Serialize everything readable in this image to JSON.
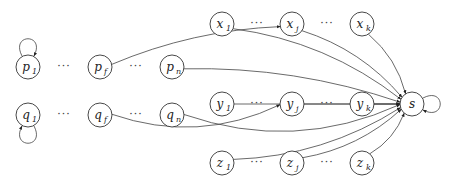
{
  "diagram": {
    "nodes": [
      {
        "id": "p1",
        "base": "p",
        "sub": "1",
        "cx": 28,
        "cy": 67
      },
      {
        "id": "pf",
        "base": "p",
        "sub": "f",
        "cx": 100,
        "cy": 67
      },
      {
        "id": "pn",
        "base": "p",
        "sub": "n",
        "cx": 172,
        "cy": 67
      },
      {
        "id": "q1",
        "base": "q",
        "sub": "1",
        "cx": 28,
        "cy": 115
      },
      {
        "id": "qf",
        "base": "q",
        "sub": "f",
        "cx": 100,
        "cy": 115
      },
      {
        "id": "qn",
        "base": "q",
        "sub": "n",
        "cx": 172,
        "cy": 115
      },
      {
        "id": "x1",
        "base": "x",
        "sub": "1",
        "cx": 222,
        "cy": 24
      },
      {
        "id": "xj",
        "base": "x",
        "sub": "j",
        "cx": 292,
        "cy": 24
      },
      {
        "id": "xk",
        "base": "x",
        "sub": "k",
        "cx": 362,
        "cy": 24
      },
      {
        "id": "y1",
        "base": "y",
        "sub": "1",
        "cx": 222,
        "cy": 104
      },
      {
        "id": "yj",
        "base": "y",
        "sub": "j",
        "cx": 292,
        "cy": 104
      },
      {
        "id": "yk",
        "base": "y",
        "sub": "k",
        "cx": 362,
        "cy": 104
      },
      {
        "id": "z1",
        "base": "z",
        "sub": "1",
        "cx": 222,
        "cy": 163
      },
      {
        "id": "zj",
        "base": "z",
        "sub": "j",
        "cx": 292,
        "cy": 163
      },
      {
        "id": "zk",
        "base": "z",
        "sub": "k",
        "cx": 362,
        "cy": 163
      },
      {
        "id": "s",
        "base": "s",
        "sub": "",
        "cx": 412,
        "cy": 104
      }
    ],
    "ellipsis": "···",
    "ellipsis_positions": [
      {
        "x": 64,
        "y": 67
      },
      {
        "x": 136,
        "y": 67
      },
      {
        "x": 64,
        "y": 115
      },
      {
        "x": 136,
        "y": 115
      },
      {
        "x": 257,
        "y": 24
      },
      {
        "x": 327,
        "y": 24
      },
      {
        "x": 257,
        "y": 104
      },
      {
        "x": 327,
        "y": 104
      },
      {
        "x": 257,
        "y": 163
      },
      {
        "x": 327,
        "y": 163
      }
    ],
    "edges": [
      {
        "from": "pf",
        "to": "xj"
      },
      {
        "from": "pn",
        "to": "s"
      },
      {
        "from": "x1",
        "to": "s"
      },
      {
        "from": "xj",
        "to": "s"
      },
      {
        "from": "xk",
        "to": "s"
      },
      {
        "from": "y1",
        "to": "s"
      },
      {
        "from": "yj",
        "to": "s"
      },
      {
        "from": "yk",
        "to": "s"
      },
      {
        "from": "qf",
        "to": "yj"
      },
      {
        "from": "qn",
        "to": "s"
      },
      {
        "from": "z1",
        "to": "s"
      },
      {
        "from": "zj",
        "to": "s"
      },
      {
        "from": "zk",
        "to": "s"
      }
    ],
    "self_loops": [
      {
        "node": "p1",
        "side": "top"
      },
      {
        "node": "q1",
        "side": "bottom"
      },
      {
        "node": "s",
        "side": "right"
      }
    ]
  }
}
